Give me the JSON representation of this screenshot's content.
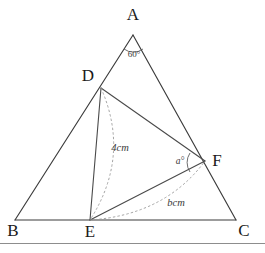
{
  "figure": {
    "vertices": {
      "A": {
        "label": "A",
        "x": 133,
        "y": 35,
        "label_x": 133,
        "label_y": 20
      },
      "B": {
        "label": "B",
        "x": 15,
        "y": 220,
        "label_x": 13,
        "label_y": 236
      },
      "C": {
        "label": "C",
        "x": 236,
        "y": 220,
        "label_x": 244,
        "label_y": 236
      },
      "D": {
        "label": "D",
        "x": 101,
        "y": 88,
        "label_x": 88,
        "label_y": 81
      },
      "E": {
        "label": "E",
        "x": 90,
        "y": 220,
        "label_x": 90,
        "label_y": 237
      },
      "F": {
        "label": "F",
        "x": 205,
        "y": 161,
        "label_x": 217,
        "label_y": 166
      }
    },
    "measures": {
      "angle_A": {
        "text": "60°",
        "x": 134,
        "y": 57
      },
      "angle_F": {
        "text": "a°",
        "x": 180,
        "y": 164
      },
      "segment_DE": {
        "text": "4cm",
        "x": 120,
        "y": 151
      },
      "segment_EF": {
        "text": "bcm",
        "x": 176,
        "y": 206
      }
    },
    "edges": [
      {
        "name": "edge-AB",
        "from": "A",
        "to": "B",
        "style": "solid"
      },
      {
        "name": "edge-AC",
        "from": "A",
        "to": "C",
        "style": "solid"
      },
      {
        "name": "edge-BC",
        "from": "B",
        "to": "C",
        "style": "solid"
      },
      {
        "name": "edge-DE",
        "from": "D",
        "to": "E",
        "style": "solid"
      },
      {
        "name": "edge-DF",
        "from": "D",
        "to": "F",
        "style": "solid"
      },
      {
        "name": "edge-EF",
        "from": "E",
        "to": "F",
        "style": "solid"
      }
    ],
    "arcs": [
      {
        "name": "arc-DE",
        "from": "D",
        "to": "E",
        "style": "dashed",
        "bulge": "right"
      },
      {
        "name": "arc-EF",
        "from": "E",
        "to": "F",
        "style": "dashed",
        "bulge": "down"
      }
    ],
    "colors": {
      "background": "#ffffff",
      "stroke": "#3b3b3b",
      "dashed": "#9a9a9a",
      "text": "#1a1a1a",
      "rule": "#8d8d8d"
    }
  }
}
